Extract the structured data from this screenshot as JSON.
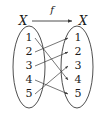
{
  "figure": {
    "type": "function-mapping-diagram",
    "title_arrow_label": "f",
    "domain_label": "X",
    "codomain_label": "X",
    "domain_elements": [
      "1",
      "2",
      "3",
      "4",
      "5"
    ],
    "codomain_elements": [
      "1",
      "2",
      "3",
      "4",
      "5"
    ],
    "mappings": [
      {
        "from": "1",
        "to": "4"
      },
      {
        "from": "2",
        "to": "1"
      },
      {
        "from": "3",
        "to": "2"
      },
      {
        "from": "4",
        "to": "5"
      },
      {
        "from": "5",
        "to": "3"
      }
    ],
    "colors": {
      "stroke": "#3b3b3b",
      "text": "#1a1a1a",
      "background": "#ffffff"
    }
  }
}
